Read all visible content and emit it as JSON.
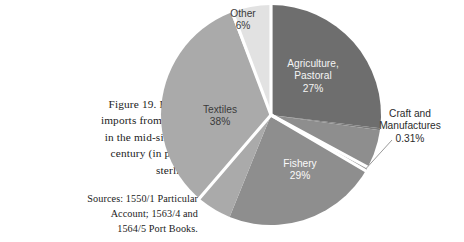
{
  "caption": {
    "figure_lines": [
      "Figure 19. Bristol's",
      "imports from Ireland",
      "in the mid-sixteenth",
      "century (in pounds",
      "sterling)."
    ],
    "sources_lines": [
      "Sources: 1550/1 Particular",
      "Account; 1563/4 and",
      "1564/5 Port Books."
    ]
  },
  "chart_data": {
    "type": "pie",
    "title": "Figure 19. Bristol's imports from Ireland in the mid-sixteenth century (in pounds sterling).",
    "categories": [
      "Agriculture, Pastoral",
      "Craft and Manufactures",
      "Fishery",
      "Textiles",
      "Other"
    ],
    "values": [
      27,
      0.31,
      29,
      38,
      6
    ],
    "value_labels": [
      "27%",
      "0.31%",
      "29%",
      "38%",
      "6%"
    ],
    "units": "percent",
    "legend": "none",
    "grid": false,
    "start_angle_deg": 0,
    "direction": "clockwise",
    "slice_colors": [
      "#6e6e6e",
      "#7a7a7a",
      "#8e8e8e",
      "#aaaaaa",
      "#e2e2e2"
    ],
    "separator_color": "#ffffff",
    "slices": [
      {
        "name": "Agriculture, Pastoral",
        "name_line_1": "Agriculture,",
        "name_line_2": "Pastoral",
        "value_label": "27%",
        "value": 27,
        "color": "#6e6e6e",
        "label_placement": "inside"
      },
      {
        "name": "Craft and Manufactures",
        "name_line_1": "Craft and",
        "name_line_2": "Manufactures",
        "value_label": "0.31%",
        "value": 0.31,
        "color": "#7a7a7a",
        "label_placement": "outside"
      },
      {
        "name": "Fishery",
        "name_line_1": "Fishery",
        "value_label": "29%",
        "value": 29,
        "color": "#8e8e8e",
        "label_placement": "inside"
      },
      {
        "name": "Textiles",
        "name_line_1": "Textiles",
        "value_label": "38%",
        "value": 38,
        "color": "#aaaaaa",
        "label_placement": "inside"
      },
      {
        "name": "Other",
        "name_line_1": "Other",
        "value_label": "6%",
        "value": 6,
        "color": "#e2e2e2",
        "label_placement": "inside"
      }
    ]
  }
}
